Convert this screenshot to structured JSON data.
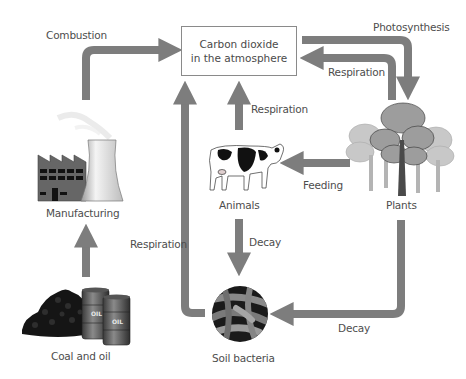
{
  "diagram": {
    "title_box": {
      "line1": "Carbon dioxide",
      "line2": "in the atmosphere"
    },
    "nodes": {
      "manufacturing": "Manufacturing",
      "coal_oil": "Coal and oil",
      "animals": "Animals",
      "plants": "Plants",
      "soil_bacteria": "Soil bacteria"
    },
    "processes": {
      "combustion": "Combustion",
      "photosynthesis": "Photosynthesis",
      "respiration_plants": "Respiration",
      "respiration_animals": "Respiration",
      "respiration_bacteria": "Respiration",
      "feeding": "Feeding",
      "decay_animals": "Decay",
      "decay_plants": "Decay"
    },
    "barrel_label": "OIL",
    "colors": {
      "arrow": "#7d7d7d",
      "box_border": "#8a8a8a",
      "text": "#4d4d4d"
    }
  }
}
